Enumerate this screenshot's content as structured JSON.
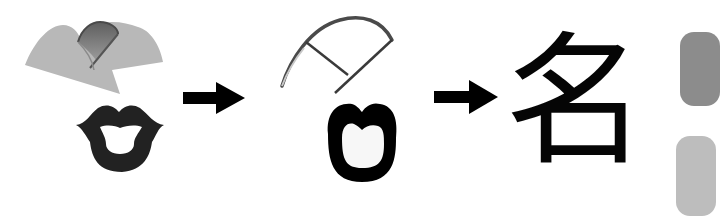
{
  "diagram": {
    "type": "character-evolution",
    "stages": [
      {
        "id": "pictograph",
        "description": "Pictographic stage: crescent moon over open lips",
        "parts": [
          {
            "name": "crescent-moon",
            "color": "#b8b8b8",
            "accent": "#7e7e7e"
          },
          {
            "name": "lips",
            "color": "#222222"
          }
        ]
      },
      {
        "id": "ancient-script",
        "description": "Ancient script stage: outlined moon stroke over mouth shape",
        "parts": [
          {
            "name": "moon-outline",
            "color": "#4a4a4a"
          },
          {
            "name": "mouth-outline",
            "color": "#000000"
          }
        ]
      },
      {
        "id": "modern-character",
        "description": "Modern character",
        "character": "名",
        "color": "#050505"
      }
    ],
    "arrows": [
      {
        "from": "pictograph",
        "to": "ancient-script",
        "color": "#000000"
      },
      {
        "from": "ancient-script",
        "to": "modern-character",
        "color": "#000000"
      }
    ],
    "edge_decor": [
      {
        "color": "#8c8c8c"
      },
      {
        "color": "#bdbdbd"
      }
    ]
  }
}
